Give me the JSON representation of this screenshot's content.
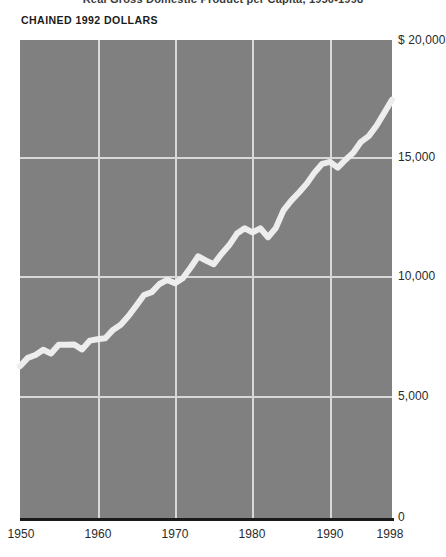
{
  "figure": {
    "title": "Real Gross Domestic Product per Capita, 1950-1998",
    "units_label": "CHAINED 1992 DOLLARS"
  },
  "axes": {
    "y_ticks": [
      {
        "label": "$ 20,000",
        "value": 20000
      },
      {
        "label": "15,000",
        "value": 15000
      },
      {
        "label": "10,000",
        "value": 10000
      },
      {
        "label": "5,000",
        "value": 5000
      },
      {
        "label": "0",
        "value": 0
      }
    ],
    "x_ticks": [
      {
        "label": "1950",
        "value": 1950
      },
      {
        "label": "1960",
        "value": 1960
      },
      {
        "label": "1970",
        "value": 1970
      },
      {
        "label": "1980",
        "value": 1980
      },
      {
        "label": "1990",
        "value": 1990
      },
      {
        "label": "1998",
        "value": 1998
      }
    ]
  },
  "colors": {
    "plot_background": "#808080",
    "gridline": "#d8d8d8",
    "data_line": "#ededed",
    "baseline": "#1a1a1a",
    "text": "#2a2a2a"
  },
  "chart_data": {
    "type": "line",
    "title": "Real Gross Domestic Product per Capita, 1950-1998",
    "xlabel": "",
    "ylabel": "CHAINED 1992 DOLLARS",
    "xlim": [
      1950,
      1998
    ],
    "ylim": [
      0,
      20000
    ],
    "grid": true,
    "legend": false,
    "x_tick_values": [
      1950,
      1960,
      1970,
      1980,
      1990,
      1998
    ],
    "y_tick_values": [
      0,
      5000,
      10000,
      15000,
      20000
    ],
    "series": [
      {
        "name": "Real GDP per capita (chained 1992 dollars)",
        "x": [
          1950,
          1951,
          1952,
          1953,
          1954,
          1955,
          1956,
          1957,
          1958,
          1959,
          1960,
          1961,
          1962,
          1963,
          1964,
          1965,
          1966,
          1967,
          1968,
          1969,
          1970,
          1971,
          1972,
          1973,
          1974,
          1975,
          1976,
          1977,
          1978,
          1979,
          1980,
          1981,
          1982,
          1983,
          1984,
          1985,
          1986,
          1987,
          1988,
          1989,
          1990,
          1991,
          1992,
          1993,
          1994,
          1995,
          1996,
          1997,
          1998
        ],
        "values": [
          6350,
          6700,
          6820,
          7040,
          6880,
          7250,
          7250,
          7260,
          7050,
          7420,
          7480,
          7520,
          7870,
          8090,
          8450,
          8880,
          9330,
          9450,
          9790,
          9960,
          9820,
          10030,
          10470,
          10950,
          10770,
          10620,
          11050,
          11420,
          11900,
          12120,
          11950,
          12120,
          11750,
          12130,
          12870,
          13280,
          13620,
          13990,
          14450,
          14820,
          14900,
          14660,
          14990,
          15280,
          15740,
          15980,
          16410,
          16950,
          17500
        ]
      }
    ]
  }
}
